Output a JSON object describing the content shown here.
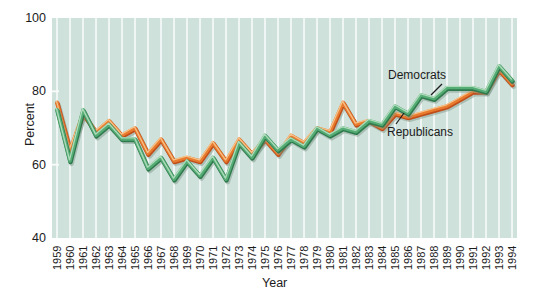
{
  "chart_data": {
    "type": "line",
    "title": "",
    "xlabel": "Year",
    "ylabel": "Percent",
    "x": [
      1959,
      1960,
      1961,
      1962,
      1963,
      1964,
      1965,
      1966,
      1967,
      1968,
      1969,
      1970,
      1971,
      1972,
      1973,
      1974,
      1975,
      1976,
      1977,
      1978,
      1979,
      1980,
      1981,
      1982,
      1983,
      1984,
      1985,
      1986,
      1987,
      1988,
      1989,
      1990,
      1991,
      1992,
      1993,
      1994
    ],
    "ylim": [
      40,
      100
    ],
    "yticks": [
      100,
      80,
      60,
      40
    ],
    "grid": "vertical-white-gridlines-each-year",
    "legend_position": "inline-annotations-with-pointer-lines",
    "series": [
      {
        "name": "Democrats",
        "color": "#55ac75",
        "light": "#aedbba",
        "dark": "#2e7a4c",
        "values": [
          75,
          61,
          75,
          68,
          71,
          67,
          67,
          59,
          62,
          56,
          61,
          57,
          62,
          56,
          66,
          62,
          68,
          64,
          67,
          65,
          70,
          68,
          70,
          69,
          72,
          71,
          76,
          74,
          79,
          78,
          81,
          81,
          81,
          80,
          87,
          83
        ]
      },
      {
        "name": "Republicans",
        "color": "#e87b2e",
        "light": "#f6c188",
        "dark": "#c04e1a",
        "values": [
          77,
          64,
          74,
          69,
          72,
          68,
          70,
          63,
          67,
          61,
          62,
          61,
          66,
          61,
          67,
          63,
          67,
          63,
          68,
          66,
          70,
          69,
          77,
          71,
          72,
          70,
          74,
          73,
          74,
          75,
          76,
          78,
          80,
          80,
          86,
          82
        ]
      }
    ],
    "colors": {
      "plot_bg": "#cee1da",
      "gridline": "#f8fbfa",
      "line_shadow": "#7a9286",
      "text": "#1c1c1c"
    }
  }
}
